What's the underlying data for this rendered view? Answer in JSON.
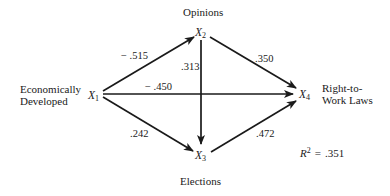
{
  "diagram": {
    "type": "path-diagram",
    "nodes": [
      {
        "id": "X1",
        "var": "X",
        "sub": "1",
        "label_lines": [
          "Economically",
          "Developed"
        ]
      },
      {
        "id": "X2",
        "var": "X",
        "sub": "2",
        "label_lines": [
          "Opinions"
        ]
      },
      {
        "id": "X3",
        "var": "X",
        "sub": "3",
        "label_lines": [
          "Elections"
        ]
      },
      {
        "id": "X4",
        "var": "X",
        "sub": "4",
        "label_lines": [
          "Right-to-",
          "Work Laws"
        ]
      }
    ],
    "edges": [
      {
        "from": "X1",
        "to": "X2",
        "coef": "− .515"
      },
      {
        "from": "X1",
        "to": "X4",
        "coef": "− .450"
      },
      {
        "from": "X1",
        "to": "X3",
        "coef": ".242"
      },
      {
        "from": "X2",
        "to": "X3",
        "coef": ".313"
      },
      {
        "from": "X2",
        "to": "X4",
        "coef": ".350"
      },
      {
        "from": "X3",
        "to": "X4",
        "coef": ".472"
      }
    ],
    "r_squared": {
      "symbol": "R",
      "sup": "2",
      "eq": "=",
      "value": ".351"
    }
  }
}
